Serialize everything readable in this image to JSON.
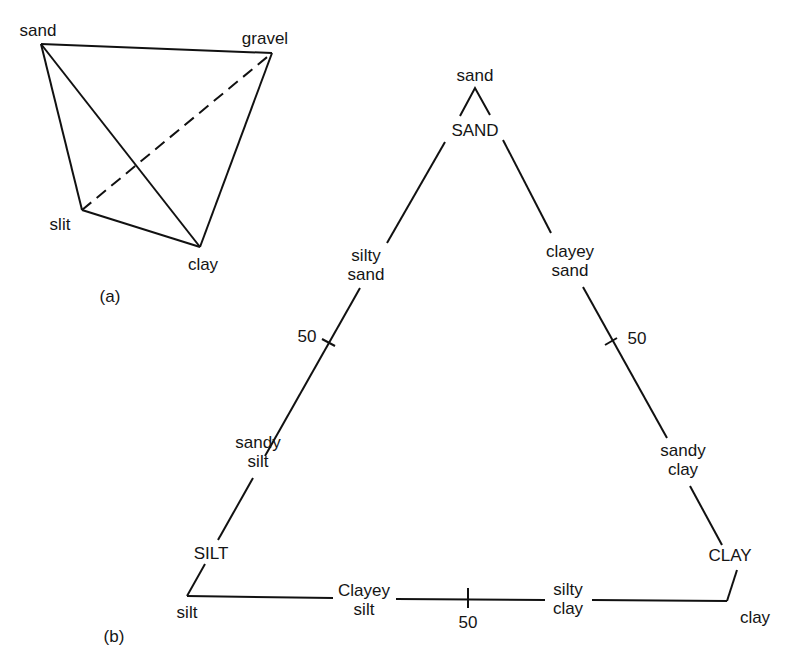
{
  "figure_a": {
    "caption": "(a)",
    "vertices": {
      "sand": "sand",
      "gravel": "gravel",
      "silt": "slit",
      "clay": "clay"
    }
  },
  "figure_b": {
    "caption": "(b)",
    "corners": {
      "top": "sand",
      "bottom_left": "silt",
      "bottom_right": "clay"
    },
    "zones": {
      "sand_zone": "SAND",
      "silt_zone": "SILT",
      "clay_zone": "CLAY"
    },
    "edge_labels": {
      "left_upper": [
        "silty",
        "sand"
      ],
      "left_lower": [
        "sandy",
        "silt"
      ],
      "right_upper": [
        "clayey",
        "sand"
      ],
      "right_lower": [
        "sandy",
        "clay"
      ],
      "bottom_left": [
        "Clayey",
        "silt"
      ],
      "bottom_right": [
        "silty",
        "clay"
      ]
    },
    "midpoint_ticks": {
      "left": "50",
      "right": "50",
      "bottom": "50"
    }
  }
}
